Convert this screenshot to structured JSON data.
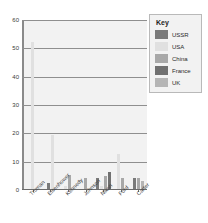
{
  "chart_data": {
    "type": "bar",
    "title": "",
    "xlabel": "",
    "ylabel": "",
    "ylim": [
      0,
      60
    ],
    "yticks": [
      0,
      10,
      20,
      30,
      40,
      50,
      60
    ],
    "grid": true,
    "legend_position": "top-right",
    "legend_title": "Key",
    "categories": [
      "Truman",
      "Eisenhower",
      "Kennedy",
      "Johnson",
      "Nixon",
      "Ford",
      "Carter"
    ],
    "series": [
      {
        "name": "USSR",
        "color": "#7a7a7a",
        "values": [
          0,
          2,
          0,
          0,
          4,
          0,
          4
        ]
      },
      {
        "name": "USA",
        "color": "#e0e0e0",
        "values": [
          52,
          19,
          1,
          0,
          1,
          12.5,
          0
        ]
      },
      {
        "name": "China",
        "color": "#a8a8a8",
        "values": [
          0,
          0,
          5,
          4,
          4.5,
          4,
          4
        ]
      },
      {
        "name": "France",
        "color": "#707070",
        "values": [
          0,
          0,
          0,
          0,
          6,
          0,
          0
        ]
      },
      {
        "name": "UK",
        "color": "#b5b5b5",
        "values": [
          0,
          0,
          0,
          0,
          0,
          0,
          3
        ]
      }
    ],
    "colors": {
      "plot_background": "#f2f2f2",
      "gridline": "#8f8f8f",
      "axis": "#6b6b6b",
      "legend_background": "#f2f2f2",
      "legend_border": "#b9b9b9",
      "text": "#3b3b3b"
    }
  }
}
